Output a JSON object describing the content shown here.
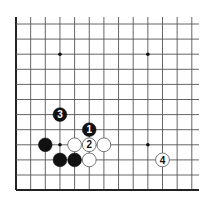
{
  "diagram": {
    "grid": {
      "columns": 13,
      "rows": 12,
      "origin_x": 16,
      "origin_y": 24,
      "col_spacing": 14.65,
      "row_spacing": 15.1,
      "line_top": 17,
      "line_right": 199,
      "open_edges": [
        "top",
        "right"
      ],
      "closed_edges": [
        "left",
        "bottom"
      ],
      "line_color": "#555555",
      "edge_color": "#222222"
    },
    "star_points": [
      {
        "col": 3,
        "row": 2
      },
      {
        "col": 9,
        "row": 2
      },
      {
        "col": 3,
        "row": 8
      },
      {
        "col": 9,
        "row": 8
      }
    ],
    "stones": [
      {
        "color": "black",
        "col": 3,
        "row": 6,
        "label": "3"
      },
      {
        "color": "black",
        "col": 5,
        "row": 7,
        "label": "1"
      },
      {
        "color": "black",
        "col": 2,
        "row": 8,
        "label": ""
      },
      {
        "color": "white",
        "col": 4,
        "row": 8,
        "label": ""
      },
      {
        "color": "white",
        "col": 5,
        "row": 8,
        "label": "2"
      },
      {
        "color": "white",
        "col": 6,
        "row": 8,
        "label": ""
      },
      {
        "color": "black",
        "col": 3,
        "row": 9,
        "label": ""
      },
      {
        "color": "black",
        "col": 4,
        "row": 9,
        "label": ""
      },
      {
        "color": "white",
        "col": 5,
        "row": 9,
        "label": ""
      },
      {
        "color": "white",
        "col": 10,
        "row": 9,
        "label": "4"
      }
    ],
    "colors": {
      "black_stone": "#111111",
      "white_stone": "#ffffff",
      "white_stone_border": "#555555",
      "background": "#ffffff"
    }
  }
}
